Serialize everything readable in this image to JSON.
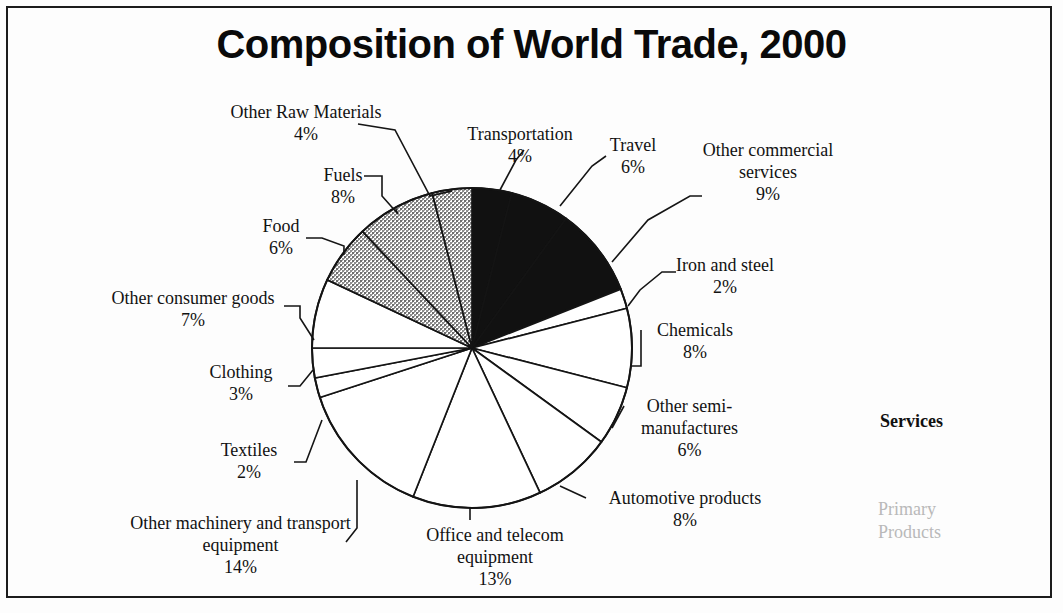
{
  "chart": {
    "title": "Composition of World Trade, 2000"
  },
  "legend": {
    "services_label": "Services",
    "primary_label": "Primary\nProducts",
    "primary_line1": "Primary",
    "primary_line2": "Products"
  },
  "labels": {
    "other_raw_materials": {
      "name": "Other Raw Materials",
      "pct": "4%"
    },
    "fuels": {
      "name": "Fuels",
      "pct": "8%"
    },
    "food": {
      "name": "Food",
      "pct": "6%"
    },
    "other_consumer_goods": {
      "name": "Other consumer goods",
      "pct": "7%"
    },
    "clothing": {
      "name": "Clothing",
      "pct": "3%"
    },
    "textiles": {
      "name": "Textiles",
      "pct": "2%"
    },
    "other_machinery": {
      "name": "Other machinery and transport equipment",
      "pct": "14%"
    },
    "office_telecom": {
      "name": "Office and telecom equipment",
      "pct": "13%"
    },
    "automotive": {
      "name": "Automotive products",
      "pct": "8%"
    },
    "other_semi": {
      "name": "Other semi-manufactures",
      "pct": "6%"
    },
    "chemicals": {
      "name": "Chemicals",
      "pct": "8%"
    },
    "iron_steel": {
      "name": "Iron and steel",
      "pct": "2%"
    },
    "other_commercial_services": {
      "name": "Other commercial services",
      "pct": "9%"
    },
    "travel": {
      "name": "Travel",
      "pct": "6%"
    },
    "transportation": {
      "name": "Transportation",
      "pct": "4%"
    }
  },
  "chart_data": {
    "type": "pie",
    "title": "Composition of World Trade, 2000",
    "start_angle_deg": 0,
    "direction": "clockwise",
    "units": "percent of world trade",
    "total": 100,
    "groups": [
      {
        "name": "Services",
        "fill": "#111111",
        "pct": 19
      },
      {
        "name": "Manufactures",
        "fill": "#ffffff",
        "pct": 63
      },
      {
        "name": "Primary Products",
        "fill": "#b0b0b0",
        "pct": 18
      }
    ],
    "categories": [
      "Transportation",
      "Travel",
      "Other commercial services",
      "Iron and steel",
      "Chemicals",
      "Other semi-manufactures",
      "Automotive products",
      "Office and telecom equipment",
      "Other machinery and transport equipment",
      "Textiles",
      "Clothing",
      "Other consumer goods",
      "Food",
      "Fuels",
      "Other Raw Materials"
    ],
    "values": [
      4,
      6,
      9,
      2,
      8,
      6,
      8,
      13,
      14,
      2,
      3,
      7,
      6,
      8,
      4
    ],
    "slices": [
      {
        "label": "Transportation",
        "value": 4,
        "group": "Services",
        "fill": "#111111"
      },
      {
        "label": "Travel",
        "value": 6,
        "group": "Services",
        "fill": "#111111"
      },
      {
        "label": "Other commercial services",
        "value": 9,
        "group": "Services",
        "fill": "#111111"
      },
      {
        "label": "Iron and steel",
        "value": 2,
        "group": "Manufactures",
        "fill": "#ffffff"
      },
      {
        "label": "Chemicals",
        "value": 8,
        "group": "Manufactures",
        "fill": "#ffffff"
      },
      {
        "label": "Other semi-manufactures",
        "value": 6,
        "group": "Manufactures",
        "fill": "#ffffff"
      },
      {
        "label": "Automotive products",
        "value": 8,
        "group": "Manufactures",
        "fill": "#ffffff"
      },
      {
        "label": "Office and telecom equipment",
        "value": 13,
        "group": "Manufactures",
        "fill": "#ffffff"
      },
      {
        "label": "Other machinery and transport equipment",
        "value": 14,
        "group": "Manufactures",
        "fill": "#ffffff"
      },
      {
        "label": "Textiles",
        "value": 2,
        "group": "Manufactures",
        "fill": "#ffffff"
      },
      {
        "label": "Clothing",
        "value": 3,
        "group": "Manufactures",
        "fill": "#ffffff"
      },
      {
        "label": "Other consumer goods",
        "value": 7,
        "group": "Manufactures",
        "fill": "#ffffff"
      },
      {
        "label": "Food",
        "value": 6,
        "group": "Primary Products",
        "fill": "#b0b0b0"
      },
      {
        "label": "Fuels",
        "value": 8,
        "group": "Primary Products",
        "fill": "#b0b0b0"
      },
      {
        "label": "Other Raw Materials",
        "value": 4,
        "group": "Primary Products",
        "fill": "#b0b0b0"
      }
    ],
    "legend": [
      "Services",
      "Primary Products"
    ],
    "legend_position": "right"
  }
}
